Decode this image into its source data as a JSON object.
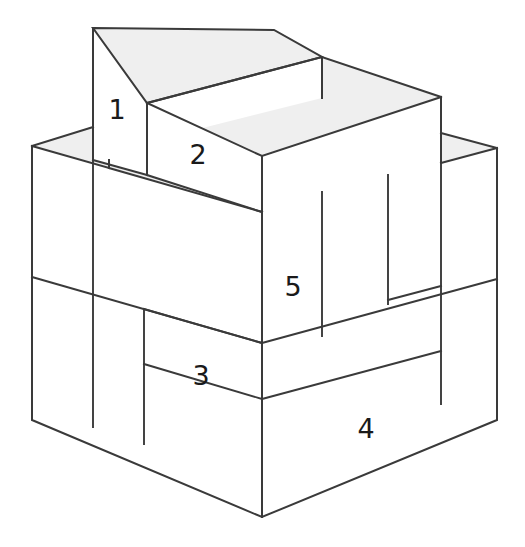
{
  "figure": {
    "background_color": "#ffffff",
    "edge_color": "#3a3a3a",
    "top_face_color": "#efefef",
    "front_face_color": "#ffffff",
    "labels": [
      {
        "text": "1",
        "x": 117,
        "y": 111
      },
      {
        "text": "2",
        "x": 198,
        "y": 156
      },
      {
        "text": "3",
        "x": 201,
        "y": 377
      },
      {
        "text": "4",
        "x": 366,
        "y": 430
      },
      {
        "text": "5",
        "x": 293,
        "y": 288
      }
    ],
    "blocks": [
      {
        "id": "block-1",
        "label": "1",
        "description": "tall narrow slab at rear left, top-most element"
      },
      {
        "id": "block-2",
        "label": "2",
        "description": "wide upper slab resting on the base, stepped down from block 1"
      },
      {
        "id": "block-3",
        "label": "3",
        "description": "lower-left front band of the base"
      },
      {
        "id": "block-4",
        "label": "4",
        "description": "bottom-right front band of the base"
      },
      {
        "id": "block-5",
        "label": "5",
        "description": "right face panel of the mid-level block"
      }
    ]
  }
}
